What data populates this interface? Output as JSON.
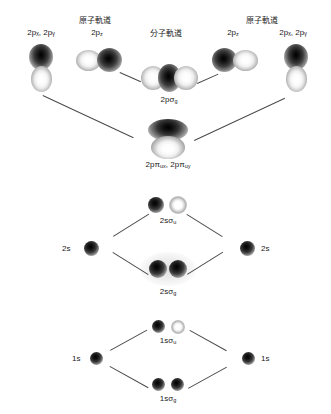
{
  "figure": {
    "watermark_lines": [
      "",
      ""
    ],
    "headers": {
      "atomic_left": "原子軌道",
      "molecular": "分子軌道",
      "atomic_right": "原子軌道"
    },
    "atomic_labels": {
      "p_left_xy": "2p",
      "p_left_xy_sub": "x, y",
      "p_left_xy_full": "2pₓ, 2pᵧ",
      "p_left_z": "2p",
      "p_left_z_sub": "z",
      "p_right_z": "2p",
      "p_right_z_sub": "z",
      "p_right_xy_full": "2pₓ, 2pᵧ",
      "s2_left": "2s",
      "s2_right": "2s",
      "s1_left": "1s",
      "s1_right": "1s"
    },
    "molecular_labels": {
      "sigma_2p_g": "2pσ",
      "sigma_2p_g_sub": "g",
      "pi_2p_u": "2pπ",
      "pi_2p_u_sub1": "ux",
      "pi_2p_u_2": "2pπ",
      "pi_2p_u_sub2": "uy",
      "sigma_2s_u": "2sσ",
      "sigma_2s_u_sub": "u",
      "sigma_2s_g": "2sσ",
      "sigma_2s_g_sub": "g",
      "sigma_1s_u": "1sσ",
      "sigma_1s_u_sub": "u",
      "sigma_1s_g": "1sσ",
      "sigma_1s_g_sub": "g"
    },
    "colors": {
      "background": "#ffffff",
      "text": "#222222",
      "line": "#4a4a4a",
      "lobe_dark": "#000000",
      "lobe_light": "#ffffff"
    }
  }
}
